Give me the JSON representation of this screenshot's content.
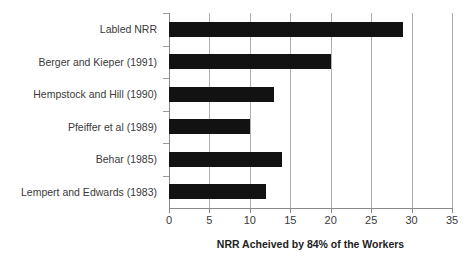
{
  "chart_data": {
    "type": "bar",
    "orientation": "horizontal",
    "title": "",
    "xlabel": "NRR Acheived by 84% of the Workers",
    "ylabel": "",
    "categories": [
      "Labled NRR",
      "Berger and Kieper (1991)",
      "Hempstock and Hill (1990)",
      "Pfeiffer et al (1989)",
      "Behar (1985)",
      "Lempert and Edwards (1983)"
    ],
    "values": [
      29,
      20,
      13,
      10,
      14,
      12
    ],
    "xlim": [
      0,
      35
    ],
    "xticks": [
      0,
      5,
      10,
      15,
      20,
      25,
      30,
      35
    ],
    "xtick_labels": [
      "0",
      "5",
      "10",
      "15",
      "20",
      "25",
      "30",
      "35"
    ],
    "grid": true,
    "grid_axis": "x",
    "legend": false,
    "legend_position": "none",
    "bar_color": "#121212",
    "grid_color": "#b0b0b0",
    "axis_color": "#8a8a8a",
    "label_color": "#3a3a3a",
    "background_color": "#ffffff"
  }
}
